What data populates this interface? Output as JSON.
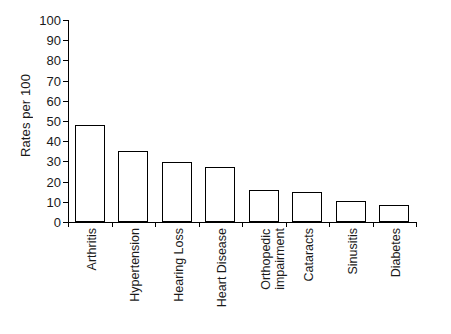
{
  "chart_data": {
    "type": "bar",
    "title": "",
    "xlabel": "",
    "ylabel": "Rates per 100",
    "ylim": [
      0,
      100
    ],
    "ytick_interval": 10,
    "yticks": [
      0,
      10,
      20,
      30,
      40,
      50,
      60,
      70,
      80,
      90,
      100
    ],
    "grid": false,
    "legend": "none",
    "bar_style": {
      "fill": "#ffffff",
      "edge": "#000000"
    },
    "categories": [
      "Arthritis",
      "Hypertension",
      "Hearing Loss",
      "Heart Disease",
      "Orthopedic impairment",
      "Cataracts",
      "Sinusitis",
      "Diabetes"
    ],
    "category_lines": [
      [
        "Arthritis"
      ],
      [
        "Hypertension"
      ],
      [
        "Hearing Loss"
      ],
      [
        "Heart Disease"
      ],
      [
        "Orthopedic",
        "impairment"
      ],
      [
        "Cataracts"
      ],
      [
        "Sinusitis"
      ],
      [
        "Diabetes"
      ]
    ],
    "values": [
      48,
      35,
      29.5,
      27,
      16,
      15,
      10.5,
      8.5
    ]
  }
}
